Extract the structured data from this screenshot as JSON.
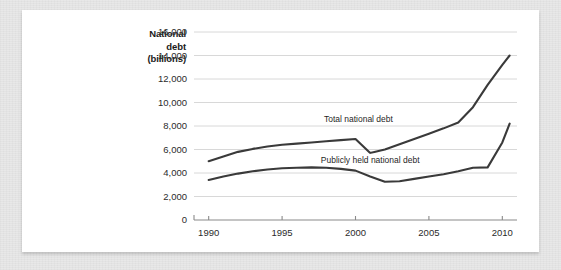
{
  "figure": {
    "axis_title_lines": [
      "National",
      "debt",
      "(billions)"
    ],
    "line_color": "#3a3a3a",
    "grid_color": "#d8d8d8",
    "axis_color": "#8a8a8a",
    "card_background": "#ffffff",
    "page_background": "#e8e8e8"
  },
  "chart_data": {
    "type": "line",
    "title": "",
    "subtitle": "",
    "xlabel": "",
    "ylabel": "National debt (billions)",
    "xlim": [
      1989,
      2011
    ],
    "ylim": [
      0,
      16000
    ],
    "grid": true,
    "grid_axis": "y",
    "legend_position": "inline-annotation",
    "ytick_labels": [
      "0",
      "2,000",
      "4,000",
      "6,000",
      "8,000",
      "10,000",
      "12,000",
      "14,000",
      "16,000"
    ],
    "ytick_values": [
      0,
      2000,
      4000,
      6000,
      8000,
      10000,
      12000,
      14000,
      16000
    ],
    "xtick_labels": [
      "1990",
      "1995",
      "2000",
      "2005",
      "2010"
    ],
    "xtick_values": [
      1990,
      1995,
      2000,
      2005,
      2010
    ],
    "x": [
      1990,
      1991,
      1992,
      1993,
      1994,
      1995,
      1996,
      1997,
      1998,
      1999,
      2000,
      2001,
      2002,
      2003,
      2004,
      2005,
      2006,
      2007,
      2008,
      2009,
      2010,
      2010.5
    ],
    "series": [
      {
        "name": "Total national debt",
        "label": "Total national debt",
        "label_x": 2000.2,
        "label_y": 8450,
        "color": "#3a3a3a",
        "values": [
          5000,
          5400,
          5800,
          6050,
          6250,
          6400,
          6500,
          6600,
          6700,
          6800,
          6900,
          5700,
          6000,
          6450,
          6900,
          7350,
          7800,
          8300,
          9600,
          11500,
          13200,
          14000
        ]
      },
      {
        "name": "Publicly held national debt",
        "label": "Publicly held national debt",
        "label_x": 2001.0,
        "label_y": 4950,
        "color": "#3a3a3a",
        "values": [
          3400,
          3700,
          3950,
          4150,
          4300,
          4400,
          4450,
          4480,
          4450,
          4350,
          4200,
          3700,
          3250,
          3300,
          3500,
          3700,
          3900,
          4150,
          4450,
          4480,
          6600,
          8200
        ]
      }
    ],
    "annotations": [
      {
        "text": "Total national debt",
        "x": 2000.2,
        "y": 8450
      },
      {
        "text": "Publicly held national debt",
        "x": 2001.0,
        "y": 4950
      }
    ]
  }
}
